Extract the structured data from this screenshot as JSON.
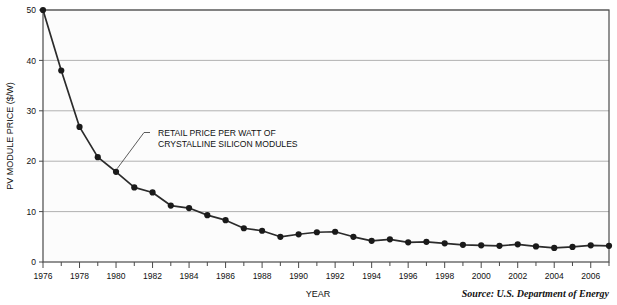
{
  "chart_data": {
    "type": "line",
    "title": "",
    "xlabel": "YEAR",
    "ylabel": "PV MODULE PRICE ($/W)",
    "xlim": [
      1976,
      2007
    ],
    "ylim": [
      0,
      50
    ],
    "grid": true,
    "legend_position": "none",
    "y_ticks": [
      "0",
      "10",
      "20",
      "30",
      "40",
      "50"
    ],
    "y_tick_values": [
      0,
      10,
      20,
      30,
      40,
      50
    ],
    "x_ticks": [
      "1976",
      "1978",
      "1980",
      "1982",
      "1984",
      "1986",
      "1988",
      "1990",
      "1992",
      "1994",
      "1996",
      "1998",
      "2000",
      "2002",
      "2004",
      "2006"
    ],
    "x_tick_values": [
      1976,
      1978,
      1980,
      1982,
      1984,
      1986,
      1988,
      1990,
      1992,
      1994,
      1996,
      1998,
      2000,
      2002,
      2004,
      2006
    ],
    "x": [
      1976,
      1977,
      1978,
      1979,
      1980,
      1981,
      1982,
      1983,
      1984,
      1985,
      1986,
      1987,
      1988,
      1989,
      1990,
      1991,
      1992,
      1993,
      1994,
      1995,
      1996,
      1997,
      1998,
      1999,
      2000,
      2001,
      2002,
      2003,
      2004,
      2005,
      2006,
      2007
    ],
    "series": [
      {
        "name": "Retail price per watt of crystalline silicon modules",
        "values": [
          50,
          38,
          26.8,
          20.8,
          17.9,
          14.8,
          13.8,
          11.2,
          10.7,
          9.3,
          8.3,
          6.7,
          6.2,
          5.0,
          5.5,
          5.9,
          6.0,
          5.0,
          4.2,
          4.5,
          3.9,
          4.0,
          3.7,
          3.4,
          3.3,
          3.2,
          3.5,
          3.1,
          2.8,
          3.0,
          3.3,
          3.2
        ],
        "color": "#2b2b2b"
      }
    ],
    "annotations": [
      {
        "name": "series-callout",
        "line1": "RETAIL PRICE PER WATT OF",
        "line2": "CRYSTALLINE SILICON MODULES",
        "points_to_year": 1980,
        "points_to_value": 17.9
      }
    ],
    "source": "Source: U.S. Department of Energy"
  },
  "colors": {
    "line": "#2b2b2b",
    "marker": "#1a1a1a",
    "grid": "#a8a8a8",
    "axis": "#4a4a4a",
    "plot_background": "#fcfcfc",
    "text": "#111111"
  }
}
